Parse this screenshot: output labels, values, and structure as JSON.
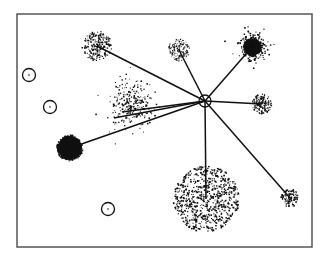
{
  "diagram": {
    "type": "hub-and-spoke cluster diagram",
    "frame": {
      "x": 17,
      "y": 14,
      "width": 295,
      "height": 233,
      "stroke": "#555555"
    },
    "colors": {
      "ink": "#111111",
      "frame": "#555555",
      "background": "#ffffff"
    },
    "hub": {
      "id": "hub",
      "cx": 205,
      "cy": 101,
      "r": 6
    },
    "clusters": [
      {
        "id": "top-left",
        "cx": 97,
        "cy": 46,
        "r": 15,
        "density": "dense",
        "count": 260,
        "dot": 1.0,
        "spread": "tight"
      },
      {
        "id": "top-center",
        "cx": 179,
        "cy": 50,
        "r": 11,
        "density": "dense",
        "count": 150,
        "dot": 0.9,
        "spread": "tight"
      },
      {
        "id": "top-right",
        "cx": 252,
        "cy": 47,
        "r": 16,
        "density": "very-dense",
        "count": 300,
        "dot": 1.2,
        "spread": "halo"
      },
      {
        "id": "right",
        "cx": 262,
        "cy": 104,
        "r": 10,
        "density": "dense",
        "count": 140,
        "dot": 1.1,
        "spread": "tight"
      },
      {
        "id": "center-scatter",
        "cx": 132,
        "cy": 104,
        "r": 24,
        "density": "sparse",
        "count": 260,
        "dot": 1.1,
        "spread": "scatter"
      },
      {
        "id": "left-dark",
        "cx": 70,
        "cy": 148,
        "r": 13,
        "density": "solid",
        "count": 320,
        "dot": 1.3,
        "spread": "tight"
      },
      {
        "id": "bottom-large",
        "cx": 206,
        "cy": 199,
        "r": 33,
        "density": "medium",
        "count": 700,
        "dot": 1.2,
        "spread": "uniform"
      },
      {
        "id": "bottom-right",
        "cx": 290,
        "cy": 198,
        "r": 9,
        "density": "dense",
        "count": 110,
        "dot": 1.1,
        "spread": "tight"
      }
    ],
    "edges": [
      {
        "from": "hub",
        "to": "top-left"
      },
      {
        "from": "hub",
        "to": "top-center"
      },
      {
        "from": "hub",
        "to": "top-right"
      },
      {
        "from": "hub",
        "to": "right"
      },
      {
        "from": "hub",
        "to": "bottom-right"
      },
      {
        "from": "hub",
        "to": "bottom-large"
      },
      {
        "from": "hub",
        "to": "left-dark"
      },
      {
        "from": "hub",
        "to": "center-scatter",
        "target_offset": [
          -10,
          8
        ]
      },
      {
        "from": "hub",
        "to": "center-scatter",
        "target_offset": [
          -18,
          14
        ]
      }
    ],
    "empty_nodes": [
      {
        "id": "empty-1",
        "cx": 29,
        "cy": 75,
        "r": 6.5
      },
      {
        "id": "empty-2",
        "cx": 50,
        "cy": 107,
        "r": 6.5
      },
      {
        "id": "empty-3",
        "cx": 108,
        "cy": 209,
        "r": 6.5
      }
    ]
  }
}
